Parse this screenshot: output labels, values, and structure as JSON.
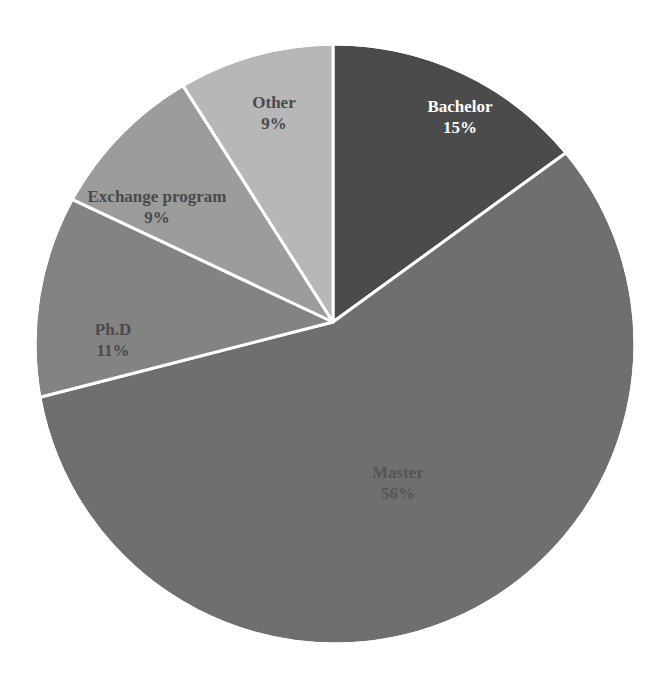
{
  "chart_data": {
    "type": "pie",
    "title": "",
    "categories": [
      "Bachelor",
      "Master",
      "Ph.D",
      "Exchange program",
      "Other"
    ],
    "values": [
      15,
      56,
      11,
      9,
      9
    ],
    "unit": "%",
    "legend": "none (data labels inside slices)",
    "slices": [
      {
        "label": "Bachelor",
        "value": 15,
        "pct_label": "15%",
        "color": "#4b4b4b",
        "text_color": "#ffffff",
        "label_x": 460,
        "label_y": 112
      },
      {
        "label": "Master",
        "value": 56,
        "pct_label": "56%",
        "color": "#6f6f6f",
        "text_color": "#555555",
        "label_x": 398,
        "label_y": 478
      },
      {
        "label": "Ph.D",
        "value": 11,
        "pct_label": "11%",
        "color": "#838383",
        "text_color": "#4a4a4a",
        "label_x": 113,
        "label_y": 335
      },
      {
        "label": "Exchange program",
        "value": 9,
        "pct_label": "9%",
        "color": "#9c9c9c",
        "text_color": "#4a4a4a",
        "label_x": 157,
        "label_y": 202
      },
      {
        "label": "Other",
        "value": 9,
        "pct_label": "9%",
        "color": "#b7b7b7",
        "text_color": "#4a4a4a",
        "label_x": 274,
        "label_y": 108
      }
    ]
  }
}
